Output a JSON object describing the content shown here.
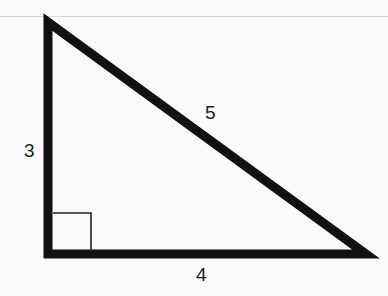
{
  "diagram": {
    "type": "right-triangle",
    "vertices": {
      "top": [
        48,
        22
      ],
      "right_angle": [
        48,
        254
      ],
      "right": [
        366,
        254
      ]
    },
    "sides": {
      "vertical_leg": "3",
      "horizontal_leg": "4",
      "hypotenuse": "5"
    },
    "right_angle_marker": true,
    "colors": {
      "stroke": "#111111",
      "background": "#fafafa"
    }
  }
}
